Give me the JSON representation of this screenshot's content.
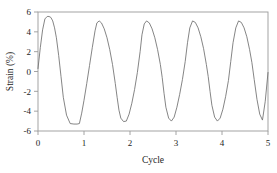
{
  "chart_data": {
    "type": "line",
    "title": "",
    "subtitle": "",
    "xlabel": "Cycle",
    "ylabel": "Strain (%)",
    "xlim": [
      0,
      5
    ],
    "ylim": [
      -6,
      6
    ],
    "xticks": [
      0,
      1,
      2,
      3,
      4,
      5
    ],
    "xticklabels": [
      "0",
      "1",
      "2",
      "3",
      "4",
      "5"
    ],
    "yticks": [
      -6,
      -4,
      -2,
      0,
      2,
      4,
      6
    ],
    "yticklabels": [
      "-6",
      "-4",
      "-2",
      "0",
      "2",
      "4",
      "6"
    ],
    "grid": false,
    "legend": null,
    "legend_position": "none",
    "line_color": "#6f6f6f",
    "frame_color": "#9a9a9a",
    "series": [
      {
        "name": "Strain",
        "x": [
          0.0,
          0.05,
          0.1,
          0.15,
          0.2,
          0.24,
          0.28,
          0.32,
          0.36,
          0.4,
          0.45,
          0.5,
          0.55,
          0.62,
          0.7,
          0.78,
          0.85,
          0.9,
          0.95,
          1.0,
          1.06,
          1.12,
          1.18,
          1.24,
          1.28,
          1.33,
          1.38,
          1.44,
          1.5,
          1.56,
          1.62,
          1.68,
          1.72,
          1.76,
          1.8,
          1.86,
          1.92,
          1.98,
          2.04,
          2.1,
          2.16,
          2.22,
          2.26,
          2.31,
          2.36,
          2.42,
          2.48,
          2.54,
          2.6,
          2.66,
          2.7,
          2.74,
          2.78,
          2.84,
          2.9,
          2.96,
          3.02,
          3.08,
          3.14,
          3.2,
          3.25,
          3.3,
          3.36,
          3.42,
          3.48,
          3.54,
          3.6,
          3.66,
          3.7,
          3.74,
          3.78,
          3.84,
          3.9,
          3.96,
          4.02,
          4.08,
          4.14,
          4.19,
          4.24,
          4.3,
          4.36,
          4.42,
          4.48,
          4.54,
          4.6,
          4.65,
          4.7,
          4.76,
          4.82,
          4.88,
          4.94,
          5.0
        ],
        "y": [
          0.3,
          2.4,
          4.2,
          5.3,
          5.55,
          5.55,
          5.45,
          5.1,
          4.4,
          3.4,
          1.6,
          -0.5,
          -2.6,
          -4.4,
          -5.25,
          -5.3,
          -5.3,
          -5.25,
          -4.2,
          -2.9,
          -1.2,
          0.6,
          2.4,
          4.1,
          4.9,
          5.1,
          4.9,
          4.3,
          3.4,
          2.2,
          0.7,
          -1.2,
          -2.6,
          -3.9,
          -4.7,
          -5.05,
          -5.0,
          -4.3,
          -3.2,
          -1.8,
          -0.1,
          2.0,
          3.7,
          4.8,
          5.1,
          4.9,
          4.3,
          3.4,
          2.2,
          0.7,
          -0.6,
          -2.2,
          -3.6,
          -4.7,
          -5.0,
          -4.6,
          -3.6,
          -2.3,
          -0.8,
          1.0,
          2.9,
          4.4,
          5.1,
          4.95,
          4.4,
          3.5,
          2.3,
          0.7,
          -0.5,
          -2.0,
          -3.4,
          -4.6,
          -5.0,
          -4.7,
          -3.8,
          -2.5,
          -0.9,
          1.0,
          2.9,
          4.4,
          5.1,
          4.95,
          4.4,
          3.5,
          2.2,
          0.9,
          -0.8,
          -2.8,
          -4.3,
          -4.9,
          -3.0,
          -0.1
        ],
        "peaks": [
          5.55,
          5.1,
          5.1,
          5.1,
          5.1
        ],
        "peak_x": [
          0.21,
          1.3,
          2.29,
          3.29,
          4.26
        ],
        "troughs": [
          -5.3,
          -5.05,
          -5.0,
          -5.0,
          -4.9
        ],
        "trough_x": [
          0.7,
          1.88,
          2.88,
          3.88,
          4.78
        ],
        "period": 1.0,
        "start_value": 0.3,
        "end_value": -0.1
      }
    ]
  }
}
